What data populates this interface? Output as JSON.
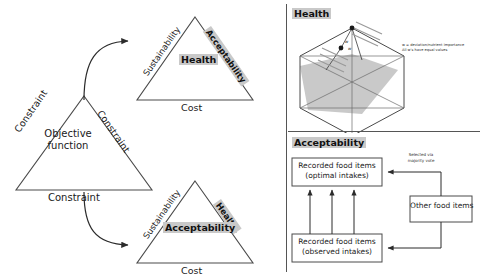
{
  "figure": {
    "left_panel": {
      "main_triangle": {
        "center_label_line1": "Objective",
        "center_label_line2": "function",
        "edge_left": "Constraint",
        "edge_right": "Constraint",
        "edge_bottom": "Constraint"
      },
      "top_triangle": {
        "edge_left": "Sustainability",
        "edge_right": "Acceptability",
        "center": "Health",
        "edge_bottom": "Cost",
        "highlighted": [
          "Acceptability",
          "Health"
        ]
      },
      "bottom_triangle": {
        "edge_left": "Sustainability",
        "edge_right": "Health",
        "center": "Acceptability",
        "edge_bottom": "Cost",
        "highlighted": [
          "Health",
          "Acceptability"
        ]
      }
    },
    "right_panel": {
      "health": {
        "header": "Health",
        "annotation_w": "w",
        "annotation_w2": "w",
        "legend_line1": "w = deviation/nutrient importance",
        "legend_line2": "All w's have equal values"
      },
      "acceptability": {
        "header": "Acceptability",
        "box_optimal_line1": "Recorded food items",
        "box_optimal_line2": "(optimal intakes)",
        "box_observed_line1": "Recorded food items",
        "box_observed_line2": "(observed intakes)",
        "box_other": "Other food items",
        "arrow_label_line1": "Selected via",
        "arrow_label_line2": "majority vote"
      }
    },
    "colors": {
      "stroke": "#4a4a4a",
      "highlight_fill": "#c9c9c9",
      "polygon_fill": "#c0c0c0",
      "text": "#1a1a1a"
    }
  }
}
